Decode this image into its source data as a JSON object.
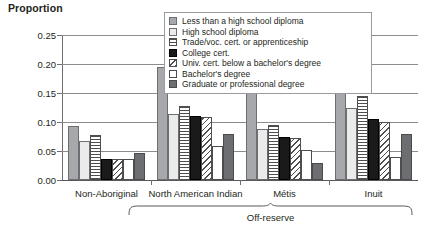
{
  "chart_data": {
    "type": "bar",
    "title": "Proportion",
    "xlabel": "",
    "ylabel": "Proportion",
    "ylim": [
      0.0,
      0.25
    ],
    "yticks": [
      "0.00",
      "0.05",
      "0.10",
      "0.15",
      "0.20",
      "0.25"
    ],
    "grid": true,
    "legend_position": "top-center",
    "categories": [
      "Non-Aboriginal",
      "North American Indian",
      "Métis",
      "Inuit"
    ],
    "group_annotation": {
      "label": "Off-reserve",
      "spans": [
        "North American Indian",
        "Métis",
        "Inuit"
      ]
    },
    "series": [
      {
        "name": "Less than a high school diploma",
        "swatch": "sw1",
        "values": [
          0.093,
          0.195,
          0.16,
          0.22
        ]
      },
      {
        "name": "High school diploma",
        "swatch": "sw2",
        "values": [
          0.068,
          0.113,
          0.088,
          0.125
        ]
      },
      {
        "name": "Trade/voc. cert. or apprenticeship",
        "swatch": "sw3",
        "values": [
          0.078,
          0.128,
          0.095,
          0.145
        ]
      },
      {
        "name": "College cert.",
        "swatch": "sw4",
        "values": [
          0.037,
          0.11,
          0.075,
          0.105
        ]
      },
      {
        "name": "Univ. cert. below a bachelor's degree",
        "swatch": "sw5",
        "values": [
          0.036,
          0.108,
          0.073,
          0.1
        ]
      },
      {
        "name": "Bachelor's degree",
        "swatch": "sw6",
        "values": [
          0.037,
          0.058,
          0.052,
          0.04
        ]
      },
      {
        "name": "Graduate or professional degree",
        "swatch": "sw7",
        "values": [
          0.046,
          0.08,
          0.03,
          0.08
        ]
      }
    ]
  }
}
